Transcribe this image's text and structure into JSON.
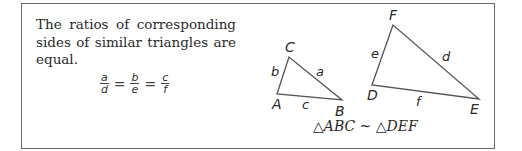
{
  "statement": {
    "text": "The ratios of corresponding sides of similar triangles are equal."
  },
  "equation": {
    "fractions": [
      {
        "numerator": "a",
        "denominator": "d"
      },
      {
        "numerator": "b",
        "denominator": "e"
      },
      {
        "numerator": "c",
        "denominator": "f"
      }
    ],
    "operator": "="
  },
  "triangle_abc": {
    "vertices": {
      "A": "A",
      "B": "B",
      "C": "C"
    },
    "sides": {
      "a": "a",
      "b": "b",
      "c": "c"
    }
  },
  "triangle_def": {
    "vertices": {
      "D": "D",
      "E": "E",
      "F": "F"
    },
    "sides": {
      "d": "d",
      "e": "e",
      "f": "f"
    }
  },
  "similarity_statement": "△ABC ~ △DEF",
  "colors": {
    "border": "#6a6a6a",
    "line": "#555555",
    "text": "#2a2a2a"
  }
}
